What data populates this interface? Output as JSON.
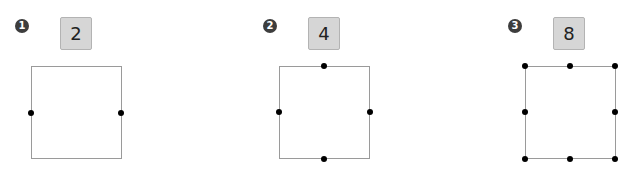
{
  "panels": [
    {
      "marker": "1",
      "count": "2",
      "dots": 2
    },
    {
      "marker": "2",
      "count": "4",
      "dots": 4
    },
    {
      "marker": "3",
      "count": "8",
      "dots": 8
    }
  ],
  "colors": {
    "dot": "#000000",
    "square_border": "#9a9a9a",
    "box_fill": "#d6d6d6",
    "marker_fill": "#3d3d3d"
  }
}
